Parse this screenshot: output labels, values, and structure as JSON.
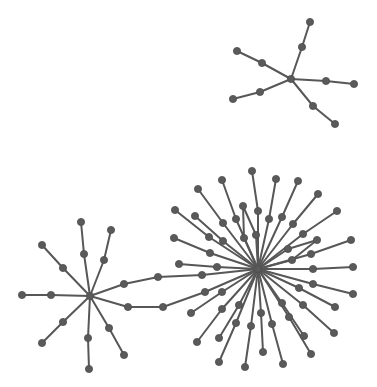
{
  "diagram": {
    "type": "network-graph",
    "background": "#ffffff",
    "node_color": "#5a5a5a",
    "edge_color": "#575757",
    "node_radius": 3.6,
    "components": [
      {
        "name": "top-right-star",
        "center": "T0"
      },
      {
        "name": "left-star",
        "center": "L0"
      },
      {
        "name": "big-star",
        "center": "B0"
      }
    ],
    "nodes": [
      {
        "id": "T0",
        "x": 291,
        "y": 79
      },
      {
        "id": "T1a",
        "x": 302,
        "y": 47
      },
      {
        "id": "T1b",
        "x": 310,
        "y": 22
      },
      {
        "id": "T2a",
        "x": 262,
        "y": 63
      },
      {
        "id": "T2b",
        "x": 237,
        "y": 51
      },
      {
        "id": "T3a",
        "x": 260,
        "y": 92
      },
      {
        "id": "T3b",
        "x": 233,
        "y": 99
      },
      {
        "id": "T4a",
        "x": 326,
        "y": 81
      },
      {
        "id": "T4b",
        "x": 354,
        "y": 84
      },
      {
        "id": "T5a",
        "x": 313,
        "y": 106
      },
      {
        "id": "T5b",
        "x": 335,
        "y": 124
      },
      {
        "id": "L0",
        "x": 90,
        "y": 296
      },
      {
        "id": "L1a",
        "x": 84,
        "y": 254
      },
      {
        "id": "L1b",
        "x": 81,
        "y": 222
      },
      {
        "id": "L2a",
        "x": 104,
        "y": 260
      },
      {
        "id": "L2b",
        "x": 111,
        "y": 230
      },
      {
        "id": "L3a",
        "x": 63,
        "y": 268
      },
      {
        "id": "L3b",
        "x": 42,
        "y": 245
      },
      {
        "id": "L4a",
        "x": 51,
        "y": 295
      },
      {
        "id": "L4b",
        "x": 22,
        "y": 295
      },
      {
        "id": "L5a",
        "x": 63,
        "y": 322
      },
      {
        "id": "L5b",
        "x": 42,
        "y": 343
      },
      {
        "id": "L6a",
        "x": 88,
        "y": 338
      },
      {
        "id": "L6b",
        "x": 89,
        "y": 369
      },
      {
        "id": "L7a",
        "x": 109,
        "y": 328
      },
      {
        "id": "L7b",
        "x": 124,
        "y": 355
      },
      {
        "id": "P1a",
        "x": 124,
        "y": 284
      },
      {
        "id": "P1b",
        "x": 158,
        "y": 277
      },
      {
        "id": "P1c",
        "x": 202,
        "y": 275
      },
      {
        "id": "P2a",
        "x": 128,
        "y": 307
      },
      {
        "id": "P2b",
        "x": 163,
        "y": 307
      },
      {
        "id": "P2c",
        "x": 205,
        "y": 292
      },
      {
        "id": "B0",
        "x": 258,
        "y": 269
      },
      {
        "id": "B1a",
        "x": 258,
        "y": 211
      },
      {
        "id": "B1b",
        "x": 252,
        "y": 171
      },
      {
        "id": "B2a",
        "x": 236,
        "y": 219
      },
      {
        "id": "B2b",
        "x": 222,
        "y": 180
      },
      {
        "id": "B3a",
        "x": 223,
        "y": 223
      },
      {
        "id": "B3b",
        "x": 198,
        "y": 189
      },
      {
        "id": "B4a",
        "x": 209,
        "y": 237
      },
      {
        "id": "B4b",
        "x": 175,
        "y": 210
      },
      {
        "id": "B5a",
        "x": 223,
        "y": 241
      },
      {
        "id": "B5b",
        "x": 195,
        "y": 216
      },
      {
        "id": "B6a",
        "x": 210,
        "y": 253
      },
      {
        "id": "B6b",
        "x": 174,
        "y": 238
      },
      {
        "id": "B7a",
        "x": 217,
        "y": 267
      },
      {
        "id": "B7b",
        "x": 179,
        "y": 264
      },
      {
        "id": "B8a",
        "x": 244,
        "y": 238
      },
      {
        "id": "B8b",
        "x": 243,
        "y": 206
      },
      {
        "id": "B8c",
        "x": 256,
        "y": 235
      },
      {
        "id": "B9a",
        "x": 269,
        "y": 219
      },
      {
        "id": "B9b",
        "x": 276,
        "y": 179
      },
      {
        "id": "B10a",
        "x": 282,
        "y": 217
      },
      {
        "id": "B10b",
        "x": 298,
        "y": 181
      },
      {
        "id": "B11a",
        "x": 293,
        "y": 224
      },
      {
        "id": "B11b",
        "x": 318,
        "y": 194
      },
      {
        "id": "B12a",
        "x": 303,
        "y": 234
      },
      {
        "id": "B12b",
        "x": 337,
        "y": 211
      },
      {
        "id": "B13a",
        "x": 311,
        "y": 254
      },
      {
        "id": "B13b",
        "x": 351,
        "y": 240
      },
      {
        "id": "B14a",
        "x": 288,
        "y": 249
      },
      {
        "id": "B14b",
        "x": 317,
        "y": 240
      },
      {
        "id": "B14c",
        "x": 292,
        "y": 260
      },
      {
        "id": "B15a",
        "x": 313,
        "y": 269
      },
      {
        "id": "B15b",
        "x": 353,
        "y": 267
      },
      {
        "id": "B16a",
        "x": 313,
        "y": 284
      },
      {
        "id": "B16b",
        "x": 353,
        "y": 294
      },
      {
        "id": "B17a",
        "x": 299,
        "y": 288
      },
      {
        "id": "B17b",
        "x": 335,
        "y": 307
      },
      {
        "id": "B18a",
        "x": 303,
        "y": 305
      },
      {
        "id": "B18b",
        "x": 334,
        "y": 333
      },
      {
        "id": "B19a",
        "x": 282,
        "y": 303
      },
      {
        "id": "B19b",
        "x": 289,
        "y": 317
      },
      {
        "id": "B19c",
        "x": 304,
        "y": 336
      },
      {
        "id": "B20a",
        "x": 289,
        "y": 317
      },
      {
        "id": "B20b",
        "x": 311,
        "y": 354
      },
      {
        "id": "B21a",
        "x": 272,
        "y": 324
      },
      {
        "id": "B21b",
        "x": 283,
        "y": 364
      },
      {
        "id": "B22a",
        "x": 261,
        "y": 313
      },
      {
        "id": "B22b",
        "x": 263,
        "y": 352
      },
      {
        "id": "B23a",
        "x": 251,
        "y": 326
      },
      {
        "id": "B23b",
        "x": 245,
        "y": 367
      },
      {
        "id": "B24a",
        "x": 236,
        "y": 323
      },
      {
        "id": "B24b",
        "x": 219,
        "y": 362
      },
      {
        "id": "B25a",
        "x": 239,
        "y": 305
      },
      {
        "id": "B25b",
        "x": 219,
        "y": 338
      },
      {
        "id": "B26a",
        "x": 222,
        "y": 309
      },
      {
        "id": "B26b",
        "x": 197,
        "y": 342
      },
      {
        "id": "B27a",
        "x": 222,
        "y": 292
      },
      {
        "id": "B27b",
        "x": 191,
        "y": 313
      },
      {
        "id": "B28b",
        "x": 163,
        "y": 307
      }
    ],
    "edges": [
      [
        "T0",
        "T1a"
      ],
      [
        "T1a",
        "T1b"
      ],
      [
        "T0",
        "T2a"
      ],
      [
        "T2a",
        "T2b"
      ],
      [
        "T0",
        "T3a"
      ],
      [
        "T3a",
        "T3b"
      ],
      [
        "T0",
        "T4a"
      ],
      [
        "T4a",
        "T4b"
      ],
      [
        "T0",
        "T5a"
      ],
      [
        "T5a",
        "T5b"
      ],
      [
        "L0",
        "L1a"
      ],
      [
        "L1a",
        "L1b"
      ],
      [
        "L0",
        "L2a"
      ],
      [
        "L2a",
        "L2b"
      ],
      [
        "L0",
        "L3a"
      ],
      [
        "L3a",
        "L3b"
      ],
      [
        "L0",
        "L4a"
      ],
      [
        "L4a",
        "L4b"
      ],
      [
        "L0",
        "L5a"
      ],
      [
        "L5a",
        "L5b"
      ],
      [
        "L0",
        "L6a"
      ],
      [
        "L6a",
        "L6b"
      ],
      [
        "L0",
        "L7a"
      ],
      [
        "L7a",
        "L7b"
      ],
      [
        "L0",
        "P1a"
      ],
      [
        "P1a",
        "P1b"
      ],
      [
        "P1b",
        "P1c"
      ],
      [
        "P1c",
        "B0"
      ],
      [
        "L0",
        "P2a"
      ],
      [
        "P2a",
        "P2b"
      ],
      [
        "P2b",
        "P2c"
      ],
      [
        "P2c",
        "B0"
      ],
      [
        "B0",
        "B1a"
      ],
      [
        "B1a",
        "B1b"
      ],
      [
        "B0",
        "B2a"
      ],
      [
        "B2a",
        "B2b"
      ],
      [
        "B0",
        "B3a"
      ],
      [
        "B3a",
        "B3b"
      ],
      [
        "B0",
        "B4a"
      ],
      [
        "B4a",
        "B4b"
      ],
      [
        "B0",
        "B5a"
      ],
      [
        "B5a",
        "B5b"
      ],
      [
        "B0",
        "B6a"
      ],
      [
        "B6a",
        "B6b"
      ],
      [
        "B0",
        "B7a"
      ],
      [
        "B7a",
        "B7b"
      ],
      [
        "B0",
        "B8a"
      ],
      [
        "B8a",
        "B8b"
      ],
      [
        "B8b",
        "B8c"
      ],
      [
        "B8c",
        "B0"
      ],
      [
        "B0",
        "B9a"
      ],
      [
        "B9a",
        "B9b"
      ],
      [
        "B0",
        "B10a"
      ],
      [
        "B10a",
        "B10b"
      ],
      [
        "B0",
        "B11a"
      ],
      [
        "B11a",
        "B11b"
      ],
      [
        "B0",
        "B12a"
      ],
      [
        "B12a",
        "B12b"
      ],
      [
        "B0",
        "B13a"
      ],
      [
        "B13a",
        "B13b"
      ],
      [
        "B0",
        "B14a"
      ],
      [
        "B14a",
        "B14b"
      ],
      [
        "B14b",
        "B14c"
      ],
      [
        "B14c",
        "B0"
      ],
      [
        "B0",
        "B15a"
      ],
      [
        "B15a",
        "B15b"
      ],
      [
        "B0",
        "B16a"
      ],
      [
        "B16a",
        "B16b"
      ],
      [
        "B0",
        "B17a"
      ],
      [
        "B17a",
        "B17b"
      ],
      [
        "B0",
        "B18a"
      ],
      [
        "B18a",
        "B18b"
      ],
      [
        "B0",
        "B19a"
      ],
      [
        "B19a",
        "B19c"
      ],
      [
        "B0",
        "B20a"
      ],
      [
        "B20a",
        "B20b"
      ],
      [
        "B0",
        "B21a"
      ],
      [
        "B21a",
        "B21b"
      ],
      [
        "B0",
        "B22a"
      ],
      [
        "B22a",
        "B22b"
      ],
      [
        "B0",
        "B23a"
      ],
      [
        "B23a",
        "B23b"
      ],
      [
        "B0",
        "B24a"
      ],
      [
        "B24a",
        "B24b"
      ],
      [
        "B0",
        "B25a"
      ],
      [
        "B25a",
        "B25b"
      ],
      [
        "B0",
        "B26a"
      ],
      [
        "B26a",
        "B26b"
      ],
      [
        "B0",
        "B27a"
      ],
      [
        "B27a",
        "B27b"
      ]
    ]
  }
}
